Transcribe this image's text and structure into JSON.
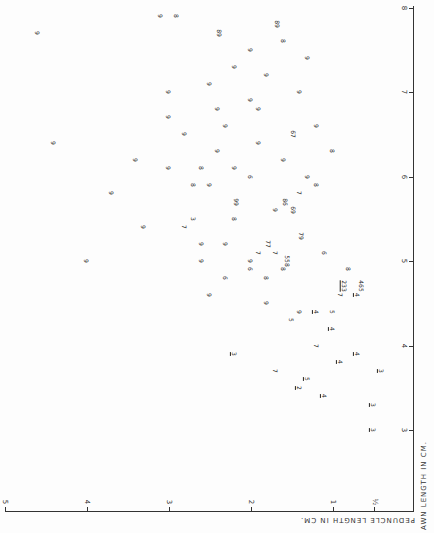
{
  "chart_data": {
    "type": "scatter",
    "title": "",
    "orientation_note": "figure printed rotated 90 degrees clockwise",
    "xlabel": "AWN LENGTH IN CM.",
    "ylabel": "PEDUNCLE LENGTH IN CM.",
    "xlim": [
      2.5,
      8
    ],
    "ylim": [
      0,
      5
    ],
    "x_ticks": [
      "3",
      "4",
      "5",
      "6",
      "7",
      "8"
    ],
    "y_ticks": [
      "½",
      "1",
      "2",
      "3",
      "4",
      "5"
    ],
    "grid": false,
    "legend": "none — each point plotted as a digit label (category code 1–9); underlined digits denote a variant class",
    "point_labels_meaning": "digit code per specimen",
    "points": [
      {
        "awn": 3.0,
        "peduncle": 0.5,
        "label": "3",
        "underlined": true
      },
      {
        "awn": 3.3,
        "peduncle": 0.5,
        "label": "3",
        "underlined": true
      },
      {
        "awn": 3.4,
        "peduncle": 1.1,
        "label": "4",
        "underlined": true
      },
      {
        "awn": 3.5,
        "peduncle": 1.4,
        "label": "2",
        "underlined": true
      },
      {
        "awn": 3.6,
        "peduncle": 1.3,
        "label": "5",
        "underlined": true
      },
      {
        "awn": 3.7,
        "peduncle": 1.7,
        "label": "7",
        "underlined": false
      },
      {
        "awn": 3.8,
        "peduncle": 0.9,
        "label": "4",
        "underlined": true
      },
      {
        "awn": 3.7,
        "peduncle": 0.4,
        "label": "3",
        "underlined": true
      },
      {
        "awn": 3.9,
        "peduncle": 2.2,
        "label": "3",
        "underlined": true
      },
      {
        "awn": 3.9,
        "peduncle": 0.7,
        "label": "4",
        "underlined": true
      },
      {
        "awn": 4.0,
        "peduncle": 1.2,
        "label": "7",
        "underlined": false
      },
      {
        "awn": 4.2,
        "peduncle": 1.0,
        "label": "4",
        "underlined": true
      },
      {
        "awn": 4.3,
        "peduncle": 1.5,
        "label": "5",
        "underlined": false
      },
      {
        "awn": 4.4,
        "peduncle": 1.4,
        "label": "9",
        "underlined": false
      },
      {
        "awn": 4.4,
        "peduncle": 1.2,
        "label": "4",
        "underlined": true
      },
      {
        "awn": 4.4,
        "peduncle": 1.0,
        "label": "5",
        "underlined": false
      },
      {
        "awn": 4.5,
        "peduncle": 1.8,
        "label": "9",
        "underlined": false
      },
      {
        "awn": 4.6,
        "peduncle": 2.5,
        "label": "9",
        "underlined": false
      },
      {
        "awn": 4.6,
        "peduncle": 0.7,
        "label": "4",
        "underlined": true
      },
      {
        "awn": 4.6,
        "peduncle": 0.9,
        "label": "7",
        "underlined": false
      },
      {
        "awn": 4.7,
        "peduncle": 0.9,
        "label": "233",
        "underlined": true
      },
      {
        "awn": 4.7,
        "peduncle": 0.7,
        "label": "465",
        "underlined": false
      },
      {
        "awn": 4.8,
        "peduncle": 1.8,
        "label": "8",
        "underlined": false
      },
      {
        "awn": 4.8,
        "peduncle": 2.3,
        "label": "6",
        "underlined": false
      },
      {
        "awn": 4.9,
        "peduncle": 1.6,
        "label": "8",
        "underlined": false
      },
      {
        "awn": 4.9,
        "peduncle": 2.0,
        "label": "6",
        "underlined": false
      },
      {
        "awn": 4.9,
        "peduncle": 0.8,
        "label": "8",
        "underlined": false
      },
      {
        "awn": 5.0,
        "peduncle": 1.6,
        "label": "558",
        "underlined": false
      },
      {
        "awn": 5.0,
        "peduncle": 4.0,
        "label": "9",
        "underlined": false
      },
      {
        "awn": 5.0,
        "peduncle": 2.6,
        "label": "9",
        "underlined": false
      },
      {
        "awn": 5.0,
        "peduncle": 2.0,
        "label": "9",
        "underlined": false
      },
      {
        "awn": 5.1,
        "peduncle": 1.9,
        "label": "7",
        "underlined": false
      },
      {
        "awn": 5.1,
        "peduncle": 1.1,
        "label": "6",
        "underlined": false
      },
      {
        "awn": 5.1,
        "peduncle": 1.7,
        "label": "7",
        "underlined": false
      },
      {
        "awn": 5.2,
        "peduncle": 1.8,
        "label": "77",
        "underlined": false
      },
      {
        "awn": 5.2,
        "peduncle": 2.6,
        "label": "9",
        "underlined": false
      },
      {
        "awn": 5.2,
        "peduncle": 2.3,
        "label": "9",
        "underlined": false
      },
      {
        "awn": 5.3,
        "peduncle": 1.4,
        "label": "79",
        "underlined": false
      },
      {
        "awn": 5.4,
        "peduncle": 3.3,
        "label": "9",
        "underlined": false
      },
      {
        "awn": 5.4,
        "peduncle": 2.8,
        "label": "7",
        "underlined": false
      },
      {
        "awn": 5.5,
        "peduncle": 2.2,
        "label": "8",
        "underlined": false
      },
      {
        "awn": 5.5,
        "peduncle": 2.7,
        "label": "3",
        "underlined": false
      },
      {
        "awn": 5.6,
        "peduncle": 1.7,
        "label": "9",
        "underlined": false
      },
      {
        "awn": 5.6,
        "peduncle": 1.5,
        "label": "69",
        "underlined": false
      },
      {
        "awn": 5.7,
        "peduncle": 1.6,
        "label": "86",
        "underlined": false
      },
      {
        "awn": 5.7,
        "peduncle": 2.2,
        "label": "99",
        "underlined": false
      },
      {
        "awn": 5.8,
        "peduncle": 3.7,
        "label": "9",
        "underlined": false
      },
      {
        "awn": 5.8,
        "peduncle": 1.4,
        "label": "7",
        "underlined": false
      },
      {
        "awn": 5.9,
        "peduncle": 2.7,
        "label": "8",
        "underlined": false
      },
      {
        "awn": 5.9,
        "peduncle": 2.5,
        "label": "9",
        "underlined": false
      },
      {
        "awn": 5.9,
        "peduncle": 1.2,
        "label": "8",
        "underlined": false
      },
      {
        "awn": 6.0,
        "peduncle": 2.0,
        "label": "6",
        "underlined": false
      },
      {
        "awn": 6.0,
        "peduncle": 1.3,
        "label": "9",
        "underlined": false
      },
      {
        "awn": 6.1,
        "peduncle": 2.6,
        "label": "8",
        "underlined": false
      },
      {
        "awn": 6.1,
        "peduncle": 3.0,
        "label": "9",
        "underlined": false
      },
      {
        "awn": 6.1,
        "peduncle": 2.2,
        "label": "9",
        "underlined": false
      },
      {
        "awn": 6.2,
        "peduncle": 3.4,
        "label": "9",
        "underlined": false
      },
      {
        "awn": 6.2,
        "peduncle": 1.6,
        "label": "9",
        "underlined": false
      },
      {
        "awn": 6.3,
        "peduncle": 2.4,
        "label": "9",
        "underlined": false
      },
      {
        "awn": 6.3,
        "peduncle": 1.0,
        "label": "8",
        "underlined": false
      },
      {
        "awn": 6.4,
        "peduncle": 1.9,
        "label": "9",
        "underlined": false
      },
      {
        "awn": 6.4,
        "peduncle": 4.4,
        "label": "9",
        "underlined": false
      },
      {
        "awn": 6.5,
        "peduncle": 2.8,
        "label": "9",
        "underlined": false
      },
      {
        "awn": 6.5,
        "peduncle": 1.5,
        "label": "67",
        "underlined": false
      },
      {
        "awn": 6.6,
        "peduncle": 2.3,
        "label": "9",
        "underlined": false
      },
      {
        "awn": 6.6,
        "peduncle": 1.2,
        "label": "9",
        "underlined": false
      },
      {
        "awn": 6.7,
        "peduncle": 3.0,
        "label": "9",
        "underlined": false
      },
      {
        "awn": 6.8,
        "peduncle": 2.4,
        "label": "9",
        "underlined": false
      },
      {
        "awn": 6.8,
        "peduncle": 1.9,
        "label": "9",
        "underlined": false
      },
      {
        "awn": 6.9,
        "peduncle": 2.0,
        "label": "9",
        "underlined": false
      },
      {
        "awn": 7.0,
        "peduncle": 3.0,
        "label": "9",
        "underlined": false
      },
      {
        "awn": 7.0,
        "peduncle": 1.4,
        "label": "9",
        "underlined": false
      },
      {
        "awn": 7.1,
        "peduncle": 2.5,
        "label": "9",
        "underlined": false
      },
      {
        "awn": 7.2,
        "peduncle": 1.8,
        "label": "9",
        "underlined": false
      },
      {
        "awn": 7.3,
        "peduncle": 2.2,
        "label": "9",
        "underlined": false
      },
      {
        "awn": 7.4,
        "peduncle": 1.3,
        "label": "9",
        "underlined": false
      },
      {
        "awn": 7.5,
        "peduncle": 2.0,
        "label": "9",
        "underlined": false
      },
      {
        "awn": 7.6,
        "peduncle": 1.6,
        "label": "8",
        "underlined": false
      },
      {
        "awn": 7.7,
        "peduncle": 4.6,
        "label": "9",
        "underlined": false
      },
      {
        "awn": 7.7,
        "peduncle": 2.4,
        "label": "89",
        "underlined": false
      },
      {
        "awn": 7.8,
        "peduncle": 1.7,
        "label": "89",
        "underlined": false
      },
      {
        "awn": 7.9,
        "peduncle": 3.1,
        "label": "9",
        "underlined": false
      },
      {
        "awn": 7.9,
        "peduncle": 2.9,
        "label": "8",
        "underlined": false
      }
    ]
  },
  "axes": {
    "awn": {
      "title": "AWN LENGTH IN CM.",
      "ticks": [
        "3",
        "4",
        "5",
        "6",
        "7",
        "8"
      ]
    },
    "peduncle": {
      "title": "PEDUNCLE LENGTH IN CM.",
      "ticks": [
        "½",
        "1",
        "2",
        "3",
        "4",
        "5"
      ]
    }
  }
}
